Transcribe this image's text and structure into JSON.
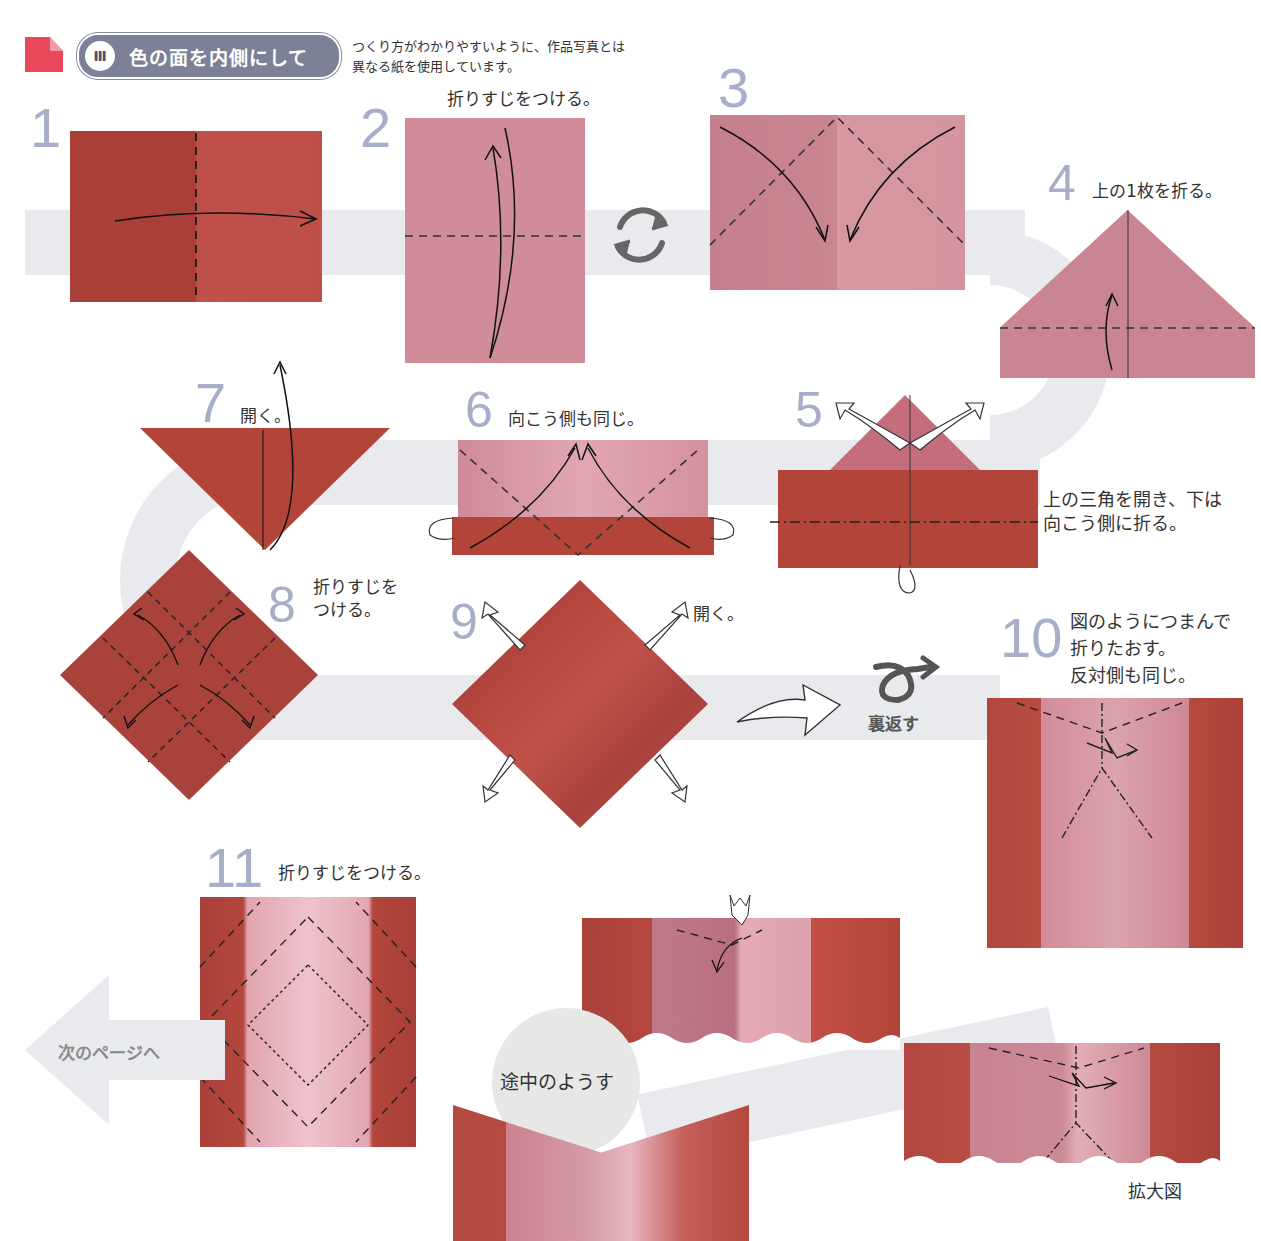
{
  "header": {
    "corner_icon": "folded-corner-icon",
    "section_number": "Ⅲ",
    "section_title": "色の面を内側にして",
    "note_line1": "つくり方がわかりやすいように、作品写真とは",
    "note_line2": "異なる紙を使用しています。"
  },
  "colors": {
    "paper_dark": "#b2443a",
    "paper_pink": "#d08c98",
    "step_number": "#a9aec8",
    "badge": "#7d8198",
    "corner_icon": "#e8485a",
    "path_band": "#e9eaee"
  },
  "steps": [
    {
      "number": "1",
      "caption": ""
    },
    {
      "number": "2",
      "caption": "折りすじをつける。"
    },
    {
      "number": "3",
      "caption": ""
    },
    {
      "number": "4",
      "caption": "上の1枚を折る。"
    },
    {
      "number": "5",
      "caption_line1": "上の三角を開き、下は",
      "caption_line2": "向こう側に折る。"
    },
    {
      "number": "6",
      "caption": "向こう側も同じ。"
    },
    {
      "number": "7",
      "caption": "開く。"
    },
    {
      "number": "8",
      "caption_line1": "折りすじを",
      "caption_line2": "つける。"
    },
    {
      "number": "9",
      "caption": "開く。"
    },
    {
      "number": "10",
      "caption_line1": "図のようにつまんで",
      "caption_line2": "折りたおす。",
      "caption_line3": "反対側も同じ。"
    },
    {
      "number": "11",
      "caption": "折りすじをつける。"
    }
  ],
  "flip": {
    "icon": "flip-over-icon",
    "label": "裏返す"
  },
  "rotate": {
    "icon": "rotate-icon"
  },
  "in_progress_label": "途中のようす",
  "enlarged_label": "拡大図",
  "next_page_label": "次のページへ"
}
